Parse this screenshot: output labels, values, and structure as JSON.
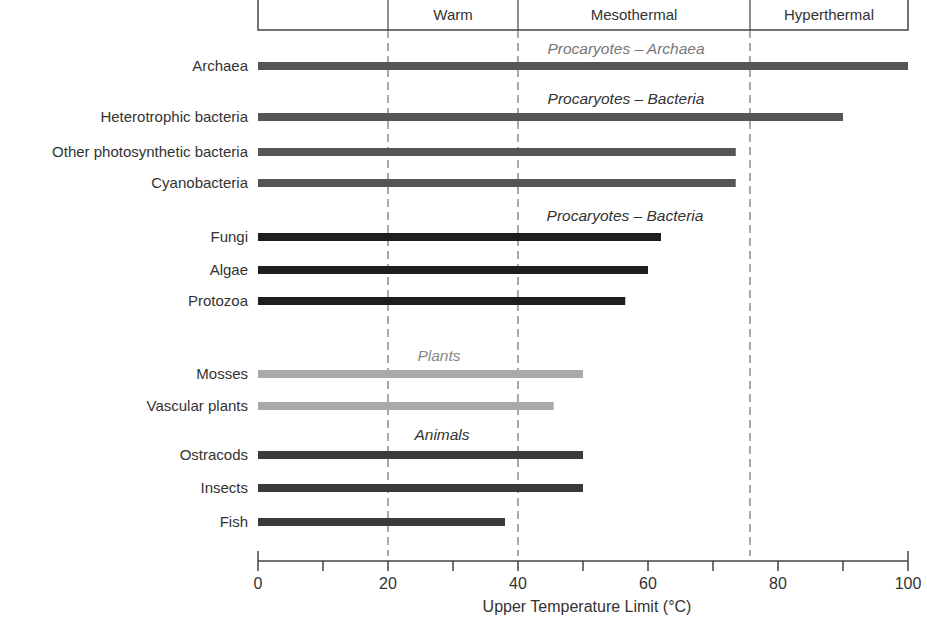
{
  "chart_data": {
    "type": "bar",
    "orientation": "horizontal",
    "title": "",
    "xlabel": "Upper Temperature Limit (°C)",
    "ylabel": "",
    "xlim": [
      0,
      100
    ],
    "xticks": [
      0,
      20,
      40,
      60,
      80,
      100
    ],
    "minor_tick_step": 10,
    "grid": false,
    "zones": [
      {
        "name": "",
        "from": 0,
        "to": 20
      },
      {
        "name": "Warm",
        "from": 20,
        "to": 40
      },
      {
        "name": "Mesothermal",
        "from": 40,
        "to": 75.5
      },
      {
        "name": "Hyperthermal",
        "from": 75.5,
        "to": 100
      }
    ],
    "zone_boundaries": [
      20,
      40,
      75.5
    ],
    "groups": [
      {
        "name": "Procaryotes – Archaea",
        "color": "#555555",
        "label_color": "#777777",
        "items": [
          {
            "label": "Archaea",
            "value": 100
          }
        ]
      },
      {
        "name": "Procaryotes – Bacteria",
        "color": "#555555",
        "label_color": "#333333",
        "items": [
          {
            "label": "Heterotrophic bacteria",
            "value": 90
          },
          {
            "label": "Other photosynthetic bacteria",
            "value": 73.5
          },
          {
            "label": "Cyanobacteria",
            "value": 73.5
          }
        ]
      },
      {
        "name": "Procaryotes – Bacteria",
        "color": "#1e1e1e",
        "label_color": "#333333",
        "items": [
          {
            "label": "Fungi",
            "value": 62
          },
          {
            "label": "Algae",
            "value": 60
          },
          {
            "label": "Protozoa",
            "value": 56.5
          }
        ]
      },
      {
        "name": "Plants",
        "color": "#aaaaaa",
        "label_color": "#888888",
        "items": [
          {
            "label": "Mosses",
            "value": 50
          },
          {
            "label": "Vascular plants",
            "value": 45.5
          }
        ]
      },
      {
        "name": "Animals",
        "color": "#3a3a3a",
        "label_color": "#333333",
        "items": [
          {
            "label": "Ostracods",
            "value": 50
          },
          {
            "label": "Insects",
            "value": 50
          },
          {
            "label": "Fish",
            "value": 38
          }
        ]
      }
    ]
  }
}
